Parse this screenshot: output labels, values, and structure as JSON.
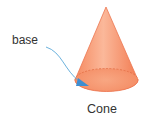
{
  "figure": {
    "labels": {
      "base": "base",
      "caption": "Cone"
    },
    "colors": {
      "cone_fill": "#f7a07a",
      "cone_edge": "#e8704a",
      "base_fill": "#f59a74",
      "arrow": "#5aa8d8",
      "text": "#333333"
    }
  }
}
